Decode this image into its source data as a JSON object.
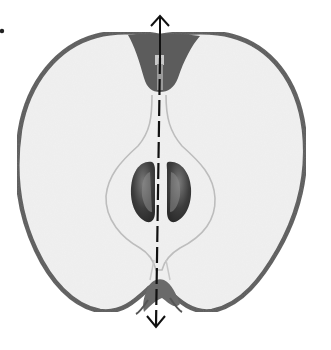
{
  "figure": {
    "annotation": "Vertical axis of symmetry (dashed line with arrows at both ends)",
    "colors": {
      "background": "#ffffff",
      "skin": "#5a5a5a",
      "flesh": "#f1f1f1",
      "core_line": "#bdbdbd",
      "stem_region": "#5c5c5c",
      "seeds": "#4a4a4a",
      "axis": "#111111"
    },
    "parts": [
      "skin",
      "flesh",
      "core",
      "seeds",
      "stem cavity",
      "calyx",
      "axis arrow"
    ]
  }
}
